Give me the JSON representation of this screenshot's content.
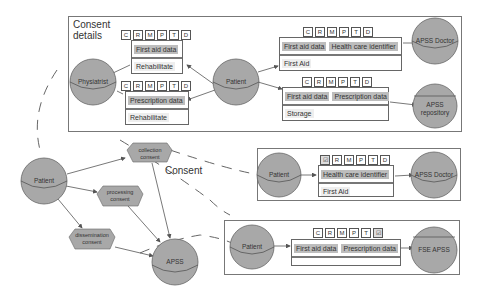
{
  "consent_details": {
    "title_line1": "Consent",
    "title_line2": "details",
    "flags_upper": [
      "C",
      "R",
      "M",
      "P",
      "T",
      "D"
    ],
    "flags_lower": [
      "C",
      "R",
      "M",
      "P",
      "T",
      "D"
    ],
    "card_top_left": {
      "data": [
        "First aid data"
      ],
      "purpose": "Rehabilitate"
    },
    "card_bottom_left": {
      "data": [
        "Prescription data"
      ],
      "purpose": "Rehabilitate"
    },
    "card_top_right": {
      "data": [
        "First aid data",
        "Health care identifier"
      ],
      "purpose": "First Aid"
    },
    "card_bottom_right": {
      "data": [
        "First aid data",
        "Prescription data"
      ],
      "purpose": "Storage"
    },
    "flags_top_right": [
      "C",
      "R",
      "M",
      "P",
      "T",
      "D"
    ],
    "flags_bottom_right": [
      "C",
      "R",
      "M",
      "P",
      "T",
      "D"
    ],
    "nodes": {
      "physiatrist": "Physiatrist",
      "patient": "Patient",
      "apss_doctor": "APSS Doctor",
      "apss_repository_1": "APSS",
      "apss_repository_2": "repository"
    }
  },
  "consent_flow": {
    "label": "Consent",
    "patient": "Patient",
    "apss": "APSS",
    "collection": [
      "collection",
      "consent"
    ],
    "processing": [
      "processing",
      "consent"
    ],
    "dissemination": [
      "dissemination",
      "consent"
    ]
  },
  "middle_box": {
    "flags": [
      "☑",
      "R",
      "M",
      "P",
      "T",
      "D"
    ],
    "data": [
      "Health care identifier"
    ],
    "purpose": "First Aid",
    "patient": "Patient",
    "target": "APSS Doctor"
  },
  "bottom_box": {
    "flags": [
      "C",
      "R",
      "M",
      "P",
      "T",
      "☑"
    ],
    "data": [
      "First aid data",
      "Prescription data"
    ],
    "purpose": "",
    "patient": "Patient",
    "target": "FSE APSS"
  },
  "colors": {
    "node_fill": "#a8a8a8",
    "chip_fill": "#bdbdbd",
    "border": "#777777"
  }
}
